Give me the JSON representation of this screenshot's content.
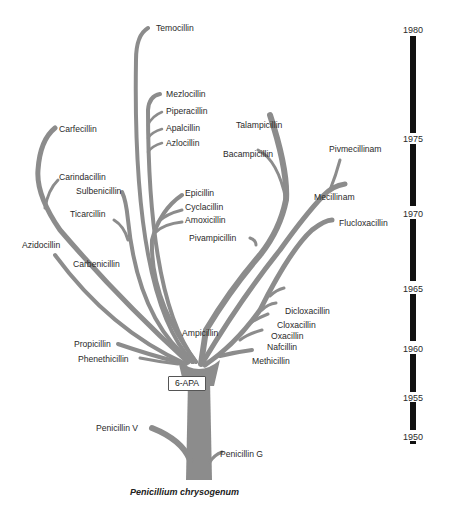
{
  "diagram": {
    "type": "family-tree",
    "title": "",
    "root": "Penicillium chrysogenum",
    "branch_color": "#8c8c8c",
    "timeline_color": "#111111",
    "core_node": "6-APA",
    "natural_penicillins": [
      "Penicillin V",
      "Penicillin G"
    ],
    "labels": {
      "temocillin": "Temocillin",
      "mezlocillin": "Mezlocillin",
      "piperacillin": "Piperacillin",
      "apalcillin": "Apalcillin",
      "azlocillin": "Azlocillin",
      "carfecillin": "Carfecillin",
      "carindacillin": "Carindacillin",
      "sulbenicillin": "Sulbenicillin",
      "ticarcillin": "Ticarcillin",
      "azidocillin": "Azidocillin",
      "carbenicillin": "Carbenicillin",
      "talampicillin": "Talampicillin",
      "bacampicillin": "Bacampicillin",
      "pivmecillinam": "Pivmecillinam",
      "mecillinam": "Mecillinam",
      "flucloxacillin": "Flucloxacillin",
      "epicillin": "Epicillin",
      "cyclacillin": "Cyclacillin",
      "amoxicillin": "Amoxicillin",
      "pivampicillin": "Pivampicillin",
      "ampicillin": "Ampicillin",
      "dicloxacillin": "Dicloxacillin",
      "cloxacillin": "Cloxacillin",
      "oxacillin": "Oxacillin",
      "nafcillin": "Nafcillin",
      "methicillin": "Methicillin",
      "propicillin": "Propicillin",
      "phenethicillin": "Phenethicillin",
      "penicillin_v": "Penicillin V",
      "penicillin_g": "Penicillin G",
      "apa": "6-APA",
      "caption": "Penicillium chrysogenum"
    },
    "timeline": {
      "years": [
        "1980",
        "1975",
        "1970",
        "1965",
        "1960",
        "1955",
        "1950"
      ]
    },
    "groups": [
      {
        "parent": "Carbenicillin",
        "children": [
          "Carfecillin",
          "Carindacillin"
        ]
      },
      {
        "parent": "Ampicillin",
        "children": [
          "Talampicillin",
          "Bacampicillin",
          "Pivampicillin",
          "Epicillin",
          "Cyclacillin",
          "Amoxicillin"
        ]
      },
      {
        "parent": "Mecillinam",
        "children": [
          "Pivmecillinam"
        ]
      },
      {
        "parent": "Ureidopenicillins",
        "children": [
          "Mezlocillin",
          "Piperacillin",
          "Apalcillin",
          "Azlocillin"
        ]
      },
      {
        "parent": "Isoxazolyl",
        "children": [
          "Oxacillin",
          "Cloxacillin",
          "Dicloxacillin",
          "Flucloxacillin"
        ]
      }
    ]
  }
}
